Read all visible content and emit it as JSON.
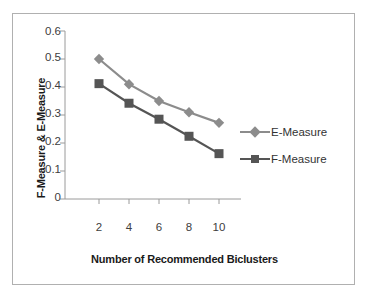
{
  "chart_data": {
    "type": "line",
    "title": "",
    "xlabel": "Number of Recommended Biclusters",
    "ylabel": "F-Measure & E-Measure",
    "x": [
      2,
      4,
      6,
      8,
      10
    ],
    "xticklabels": [
      "2",
      "4",
      "6",
      "8",
      "10"
    ],
    "yticklabels": [
      "0.6",
      "0.5",
      "0.4",
      "0.3",
      "0.2",
      "0.1",
      "0"
    ],
    "xlim": [
      1,
      11
    ],
    "ylim": [
      0,
      0.6
    ],
    "grid": false,
    "legend_position": "right",
    "series": [
      {
        "name": "E-Measure",
        "values": [
          0.5,
          0.41,
          0.35,
          0.31,
          0.272
        ],
        "color": "#8c8c8c",
        "marker": "diamond"
      },
      {
        "name": "F-Measure",
        "values": [
          0.412,
          0.342,
          0.285,
          0.224,
          0.162
        ],
        "color": "#555555",
        "marker": "square"
      }
    ]
  },
  "legend": {
    "items": [
      {
        "label": "E-Measure"
      },
      {
        "label": "F-Measure"
      }
    ]
  },
  "colors": {
    "frame_border": "#b0b0b0",
    "axis_line": "#9a9a9a",
    "text": "#333333"
  }
}
